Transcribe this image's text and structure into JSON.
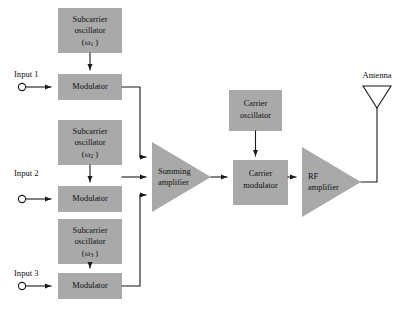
{
  "diagram": {
    "colors": {
      "block_fill": "#a9a9a9",
      "line": "#1a1a1a",
      "background": "#ffffff"
    },
    "inputs": [
      {
        "label": "Input 1"
      },
      {
        "label": "Input 2"
      },
      {
        "label": "Input 3"
      }
    ],
    "subcarrier_oscillators": [
      {
        "line1": "Subcarrier",
        "line2": "oscillator",
        "symbol": "(ω",
        "subscript": "1",
        "symbol_close": " )"
      },
      {
        "line1": "Subcarrier",
        "line2": "oscillator",
        "symbol": "(ω",
        "subscript": "2",
        "symbol_close": " )"
      },
      {
        "line1": "Subcarrier",
        "line2": "oscillator",
        "symbol": "(ω",
        "subscript": "3",
        "symbol_close": " )"
      }
    ],
    "modulators": [
      {
        "label": "Modulator"
      },
      {
        "label": "Modulator"
      },
      {
        "label": "Modulator"
      }
    ],
    "summing_amplifier": {
      "line1": "Summing",
      "line2": "amplifier"
    },
    "carrier_oscillator": {
      "line1": "Carrier",
      "line2": "oscillator"
    },
    "carrier_modulator": {
      "line1": "Carrier",
      "line2": "modulator"
    },
    "rf_amplifier": {
      "line1": "RF",
      "line2": "amplifier"
    },
    "antenna": {
      "label": "Antenna"
    }
  }
}
